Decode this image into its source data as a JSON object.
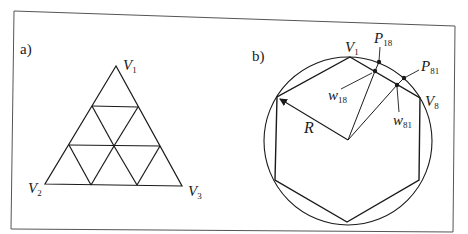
{
  "figure": {
    "panel_a": {
      "label": "a)",
      "vertices": {
        "v1": {
          "base": "V",
          "sub": "1"
        },
        "v2": {
          "base": "V",
          "sub": "2"
        },
        "v3": {
          "base": "V",
          "sub": "3"
        }
      },
      "description": "Equilateral triangle subdivided into 9 smaller triangles"
    },
    "panel_b": {
      "label": "b)",
      "vertices": {
        "v1": {
          "base": "V",
          "sub": "1"
        },
        "v8": {
          "base": "V",
          "sub": "8"
        }
      },
      "points": {
        "p18": {
          "base": "P",
          "sub": "18"
        },
        "p81": {
          "base": "P",
          "sub": "81"
        },
        "w18": {
          "base": "w",
          "sub": "18"
        },
        "w81": {
          "base": "w",
          "sub": "81"
        }
      },
      "radius_label": "R",
      "description": "Hexagon inscribed in a circle of radius R"
    }
  },
  "colors": {
    "stroke": "#1a1a1a",
    "frame": "#555555",
    "background": "#ffffff"
  }
}
